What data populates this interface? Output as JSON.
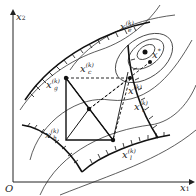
{
  "figure": {
    "axes": {
      "x_label": "x",
      "x_sub": "1",
      "y_label": "x",
      "y_sub": "2",
      "origin": "O"
    },
    "points": {
      "optimum": {
        "label": "x",
        "sup": "*"
      },
      "xe": {
        "label": "x",
        "sup": "(k)",
        "sub": "e"
      },
      "xc": {
        "label": "x",
        "sup": "(k)",
        "sub": "c"
      },
      "xg": {
        "label": "x",
        "sup": "(k)",
        "sub": "g"
      },
      "xh": {
        "label": "x",
        "sup": "(k)",
        "sub": "h"
      },
      "xr": {
        "label": "x",
        "sup": "(k)",
        "sub": "r"
      },
      "xl": {
        "label": "x",
        "sup": "(k)",
        "sub": "l"
      },
      "xk": {
        "label": "x",
        "sup": "(k)"
      }
    }
  }
}
